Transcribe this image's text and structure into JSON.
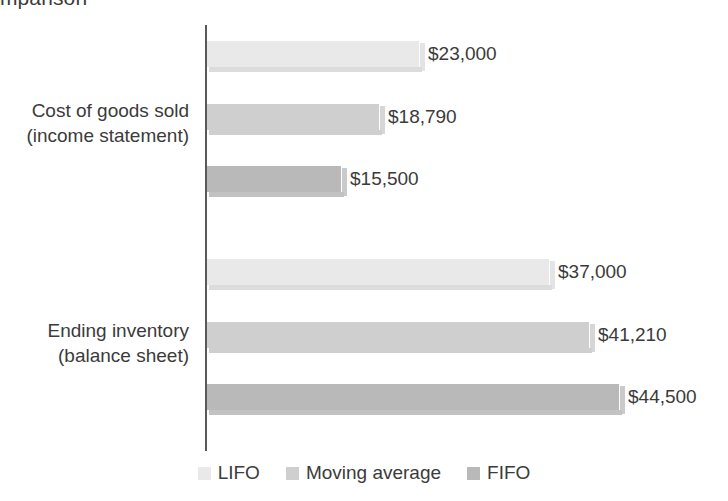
{
  "chart_data": {
    "type": "bar",
    "orientation": "horizontal",
    "title": "mparison",
    "xlabel": "",
    "ylabel": "",
    "categories": [
      "Cost of goods sold\n(income statement)",
      "Ending inventory\n(balance sheet)"
    ],
    "category_lines": [
      [
        "Cost of goods sold",
        "(income statement)"
      ],
      [
        "Ending inventory",
        "(balance sheet)"
      ]
    ],
    "series": [
      {
        "name": "LIFO",
        "color": "#e9e9e9",
        "values": [
          23000,
          37000
        ],
        "labels": [
          "$23,000",
          "$37,000"
        ]
      },
      {
        "name": "Moving average",
        "color": "#cfcfcf",
        "values": [
          18790,
          41210
        ],
        "labels": [
          "$18,790",
          "$41,210"
        ]
      },
      {
        "name": "FIFO",
        "color": "#b9b9b9",
        "values": [
          15500,
          44500
        ],
        "labels": [
          "$15,500",
          "$44,500"
        ]
      }
    ],
    "xlim": [
      0,
      50000
    ],
    "grid": false,
    "legend_position": "bottom",
    "axis_line_color": "#58595b"
  },
  "legend": {
    "items": [
      {
        "label": "LIFO",
        "color": "#e9e9e9"
      },
      {
        "label": "Moving average",
        "color": "#cfcfcf"
      },
      {
        "label": "FIFO",
        "color": "#b9b9b9"
      }
    ]
  },
  "bars": [
    {
      "label": "$23,000",
      "width": 213,
      "top": 41,
      "color": "#e9e9e9",
      "shade": "",
      "label_x": 428
    },
    {
      "label": "$18,790",
      "width": 173,
      "top": 104,
      "color": "#cfcfcf",
      "shade": "shade-med",
      "label_x": 388
    },
    {
      "label": "$15,500",
      "width": 135,
      "top": 166,
      "color": "#b9b9b9",
      "shade": "shade-dark",
      "label_x": 350
    },
    {
      "label": "$37,000",
      "width": 343,
      "top": 259,
      "color": "#e9e9e9",
      "shade": "",
      "label_x": 558
    },
    {
      "label": "$41,210",
      "width": 383,
      "top": 322,
      "color": "#cfcfcf",
      "shade": "shade-med",
      "label_x": 598
    },
    {
      "label": "$44,500",
      "width": 413,
      "top": 384,
      "color": "#b9b9b9",
      "shade": "shade-dark",
      "label_x": 628
    }
  ],
  "category_labels": [
    {
      "line1": "Cost of goods sold",
      "line2": "(income statement)",
      "top": 98
    },
    {
      "line1": "Ending inventory",
      "line2": "(balance sheet)",
      "top": 318
    }
  ]
}
